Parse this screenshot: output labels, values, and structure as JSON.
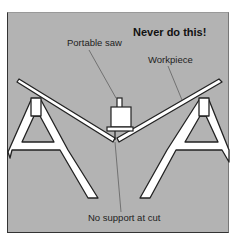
{
  "figure": {
    "title": "Never do this!",
    "labels": {
      "saw": "Portable saw",
      "workpiece": "Workpiece",
      "cut": "No support at cut"
    },
    "colors": {
      "background": "#b3b3b3",
      "parts": "#ffffff",
      "outline": "#222222",
      "leader": "#555555"
    }
  }
}
